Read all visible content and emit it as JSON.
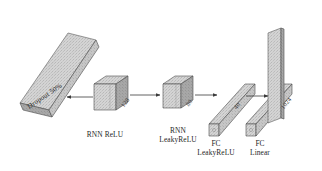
{
  "figure": {
    "type": "neural-network-architecture-diagram",
    "background": "#ffffff",
    "ink": "#2b2b2b"
  },
  "palette": {
    "face_light": "#dcdcdc",
    "face_mid": "#c4c4c4",
    "face_dark": "#9a9a9a",
    "slab_light": "#d2d2d2",
    "slab_mid": "#bdbdbd",
    "edge": "#4a4a4a",
    "arrow": "#3b3b3b",
    "text": "#272727"
  },
  "layers": [
    {
      "id": "input-slab",
      "shape": "plane",
      "label": "",
      "annotation": "Dropout 50%",
      "dim": ""
    },
    {
      "id": "rnn-relu",
      "shape": "cube",
      "label": "RNN ReLU",
      "label_lines": [
        "RNN ReLU"
      ],
      "dim": "128"
    },
    {
      "id": "rnn-leakyrelu",
      "shape": "cube",
      "label": "RNN LeakyReLU",
      "label_lines": [
        "RNN",
        "LeakyReLU"
      ],
      "dim": "80"
    },
    {
      "id": "fc-leakyrelu",
      "shape": "bar",
      "label": "FC LeakyReLU",
      "label_lines": [
        "FC",
        "LeakyReLU"
      ],
      "dim": "40"
    },
    {
      "id": "fc-linear",
      "shape": "bar",
      "label": "FC Linear",
      "label_lines": [
        "FC",
        "Linear"
      ],
      "dim": "1024"
    },
    {
      "id": "output-plane",
      "shape": "plane",
      "label": "",
      "dim": ""
    }
  ],
  "labels": {
    "dropout": "Dropout 50%",
    "rnn_relu": "RNN ReLU",
    "rnn_leaky_1": "RNN",
    "rnn_leaky_2": "LeakyReLU",
    "fc_leaky_1": "FC",
    "fc_leaky_2": "LeakyReLU",
    "fc_linear_1": "FC",
    "fc_linear_2": "Linear"
  },
  "dims": {
    "rnn_relu": "128",
    "rnn_leaky": "80",
    "fc_leaky": "40",
    "fc_linear": "1024"
  },
  "arrows": [
    {
      "id": "arrow-to-input",
      "direction": "left"
    },
    {
      "id": "arrow-rnn1-to-rnn2",
      "direction": "right"
    },
    {
      "id": "arrow-rnn2-to-fc1",
      "direction": "right"
    },
    {
      "id": "arrow-fc1-to-fc2",
      "direction": "right"
    }
  ]
}
